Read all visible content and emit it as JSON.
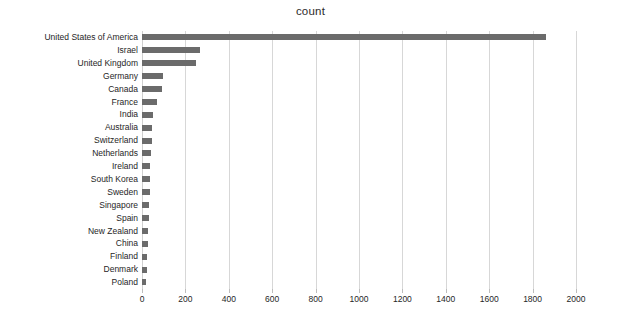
{
  "chart_data": {
    "type": "bar",
    "orientation": "horizontal",
    "title": "count",
    "xlabel": "",
    "ylabel": "",
    "xlim": [
      0,
      2000
    ],
    "xticks": [
      0,
      200,
      400,
      600,
      800,
      1000,
      1200,
      1400,
      1600,
      1800,
      2000
    ],
    "xtick_labels": [
      "0",
      "200",
      "400",
      "600",
      "800",
      "1000",
      "1200",
      "1400",
      "1600",
      "1800",
      "2000"
    ],
    "grid": true,
    "grid_axis": "x",
    "legend": false,
    "bar_color": "#6b6b6b",
    "grid_color": "#d7d7d7",
    "categories": [
      "United States of America",
      "Israel",
      "United Kingdom",
      "Germany",
      "Canada",
      "France",
      "India",
      "Australia",
      "Switzerland",
      "Netherlands",
      "Ireland",
      "South Korea",
      "Sweden",
      "Singapore",
      "Spain",
      "New Zealand",
      "China",
      "Finland",
      "Denmark",
      "Poland"
    ],
    "values": [
      1862,
      267,
      249,
      95,
      93,
      70,
      52,
      47,
      44,
      41,
      39,
      37,
      35,
      33,
      31,
      29,
      26,
      24,
      22,
      20
    ]
  }
}
